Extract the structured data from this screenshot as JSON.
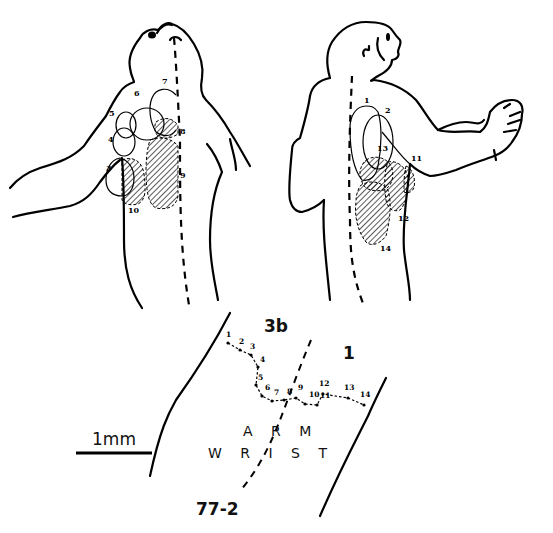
{
  "figure": {
    "left_figure": {
      "description": "monkey-dorsal-view-receptive-fields",
      "open_field_labels": [
        "3",
        "4",
        "5",
        "6",
        "7"
      ],
      "hatched_field_labels": [
        "8",
        "9",
        "10"
      ]
    },
    "right_figure": {
      "description": "monkey-back-view-receptive-fields",
      "open_field_labels": [
        "1",
        "2"
      ],
      "hatched_field_labels": [
        "11",
        "12",
        "13",
        "14"
      ]
    },
    "cortex_map": {
      "area_left_label": "3b",
      "area_right_label": "1",
      "region_top_label": "A R M",
      "region_bottom_label": "W R I  S T",
      "track_id": "77-2",
      "track_points": [
        "1",
        "2",
        "3",
        "4",
        "5",
        "6",
        "7",
        "8",
        "9",
        "10",
        "11",
        "12",
        "13",
        "14"
      ]
    },
    "scale_bar": {
      "label": "1mm"
    }
  }
}
